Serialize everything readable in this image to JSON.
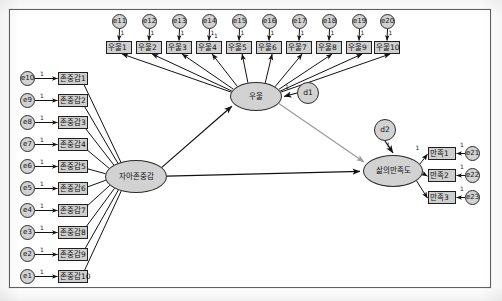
{
  "diagram": {
    "type": "sem-path-diagram",
    "frame_border_color": "#5d6166",
    "node_fill": "#d2d2d2",
    "node_stroke": "#1f1f1f",
    "gray_path_color": "#9a9a9a",
    "black_path_color": "#111111"
  },
  "latents": [
    {
      "id": "self_esteem",
      "label": "자아존중감",
      "x": 105,
      "y": 160,
      "w": 62,
      "h": 33
    },
    {
      "id": "depression",
      "label": "우울",
      "x": 230,
      "y": 82,
      "w": 52,
      "h": 29
    },
    {
      "id": "life_satisfaction",
      "label": "삶의만족도",
      "x": 363,
      "y": 155,
      "w": 60,
      "h": 32
    }
  ],
  "disturbances": [
    {
      "id": "d1",
      "label": "d1",
      "x": 297,
      "y": 82,
      "d": 22,
      "weight": "1"
    },
    {
      "id": "d2",
      "label": "d2",
      "x": 374,
      "y": 119,
      "d": 22,
      "weight": "1"
    }
  ],
  "depression_errors": {
    "weight": "1",
    "items": [
      {
        "error": "e11",
        "ex": 112,
        "ey": 14,
        "indicator": "우울1",
        "bx": 106,
        "by": 41
      },
      {
        "error": "e12",
        "ex": 142,
        "ey": 14,
        "indicator": "우울2",
        "bx": 136,
        "by": 41
      },
      {
        "error": "e13",
        "ex": 172,
        "ey": 14,
        "indicator": "우울3",
        "bx": 166,
        "by": 41
      },
      {
        "error": "e14",
        "ex": 202,
        "ey": 14,
        "indicator": "우울4",
        "bx": 196,
        "by": 41
      },
      {
        "error": "e15",
        "ex": 232,
        "ey": 14,
        "indicator": "우울5",
        "bx": 226,
        "by": 41
      },
      {
        "error": "e16",
        "ex": 262,
        "ey": 14,
        "indicator": "우울6",
        "bx": 256,
        "by": 41
      },
      {
        "error": "e17",
        "ex": 292,
        "ey": 14,
        "indicator": "우울7",
        "bx": 286,
        "by": 41
      },
      {
        "error": "e18",
        "ex": 322,
        "ey": 14,
        "indicator": "우울8",
        "bx": 316,
        "by": 41
      },
      {
        "error": "e19",
        "ex": 352,
        "ey": 14,
        "indicator": "우울9",
        "bx": 346,
        "by": 41
      },
      {
        "error": "e20",
        "ex": 380,
        "ey": 14,
        "indicator": "우울10",
        "bx": 374,
        "by": 41
      }
    ]
  },
  "esteem_errors": {
    "weight": "1",
    "items": [
      {
        "error": "e10",
        "ex": 20,
        "ey": 71,
        "indicator": "존중감1",
        "bx": 58,
        "by": 72
      },
      {
        "error": "e9",
        "ex": 20,
        "ey": 93,
        "indicator": "존중감2",
        "bx": 58,
        "by": 94
      },
      {
        "error": "e8",
        "ex": 20,
        "ey": 115,
        "indicator": "존중감3",
        "bx": 58,
        "by": 116
      },
      {
        "error": "e7",
        "ex": 20,
        "ey": 137,
        "indicator": "존중감4",
        "bx": 58,
        "by": 138
      },
      {
        "error": "e6",
        "ex": 20,
        "ey": 159,
        "indicator": "존중감5",
        "bx": 58,
        "by": 160
      },
      {
        "error": "e5",
        "ex": 20,
        "ey": 181,
        "indicator": "존중감6",
        "bx": 58,
        "by": 182
      },
      {
        "error": "e4",
        "ex": 20,
        "ey": 203,
        "indicator": "존중감7",
        "bx": 58,
        "by": 204
      },
      {
        "error": "e3",
        "ex": 20,
        "ey": 225,
        "indicator": "존중감8",
        "bx": 58,
        "by": 226
      },
      {
        "error": "e2",
        "ex": 20,
        "ey": 247,
        "indicator": "존중감9",
        "bx": 58,
        "by": 248
      },
      {
        "error": "e1",
        "ex": 20,
        "ey": 269,
        "indicator": "존중감10",
        "bx": 58,
        "by": 270
      }
    ]
  },
  "satisfaction_errors": {
    "weight": "1",
    "items": [
      {
        "error": "e21",
        "ex": 465,
        "ey": 146,
        "indicator": "만족1",
        "bx": 428,
        "by": 147,
        "loading": "1"
      },
      {
        "error": "e22",
        "ex": 465,
        "ey": 168,
        "indicator": "만족2",
        "bx": 428,
        "by": 169,
        "loading": ""
      },
      {
        "error": "e23",
        "ex": 465,
        "ey": 190,
        "indicator": "만족3",
        "bx": 428,
        "by": 191,
        "loading": ""
      }
    ]
  },
  "structural_paths": [
    {
      "from": "자아존중감",
      "to": "우울",
      "style": "black"
    },
    {
      "from": "자아존중감",
      "to": "삶의만족도",
      "style": "black"
    },
    {
      "from": "우울",
      "to": "삶의만족도",
      "style": "gray"
    },
    {
      "from": "d1",
      "to": "우울",
      "style": "black",
      "label": "1"
    },
    {
      "from": "d2",
      "to": "삶의만족도",
      "style": "black",
      "label": "1"
    }
  ]
}
